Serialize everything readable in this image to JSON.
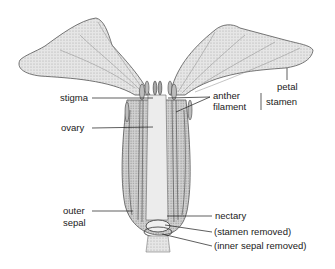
{
  "diagram": {
    "labels": {
      "petal": "petal",
      "stigma": "stigma",
      "anther": "anther",
      "filament": "filament",
      "stamen": "stamen",
      "ovary": "ovary",
      "outer_sepal_line1": "outer",
      "outer_sepal_line2": "sepal",
      "nectary": "nectary",
      "stamen_removed": "(stamen removed)",
      "inner_sepal_removed": "(inner sepal removed)"
    },
    "colors": {
      "ink": "#1a1a1a",
      "petal_fill": "#e4e4e4",
      "shade": "#9a9a9a",
      "background": "#ffffff"
    }
  }
}
